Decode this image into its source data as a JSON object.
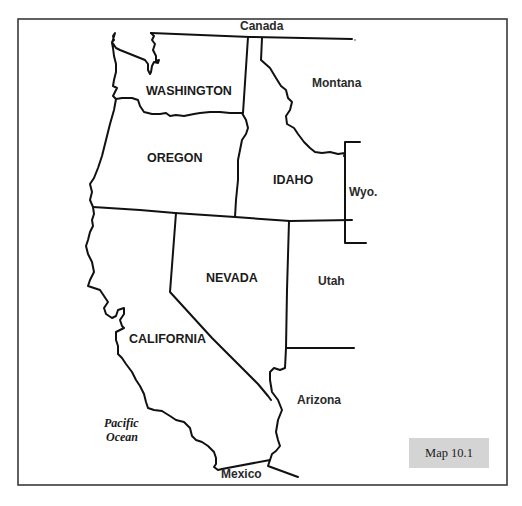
{
  "map": {
    "badge": "Map 10.1",
    "states": {
      "washington": "WASHINGTON",
      "oregon": "OREGON",
      "idaho": "IDAHO",
      "nevada": "NEVADA",
      "california": "CALIFORNIA"
    },
    "neighbors": {
      "canada": "Canada",
      "montana": "Montana",
      "wyoming": "Wyo.",
      "utah": "Utah",
      "arizona": "Arizona",
      "mexico": "Mexico"
    },
    "water": {
      "ocean_line1": "Pacific",
      "ocean_line2": "Ocean"
    },
    "colors": {
      "border": "#111111",
      "frame": "#3a3a3a",
      "badge_bg": "#d4d4d4",
      "background": "#ffffff"
    }
  }
}
